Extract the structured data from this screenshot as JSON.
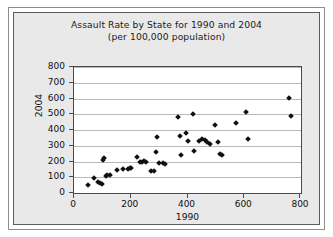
{
  "chart_data": {
    "type": "scatter",
    "title": "Assault Rate by State for 1990 and 2004",
    "subtitle": "(per 100,000 population)",
    "xlabel": "1990",
    "ylabel": "2004",
    "xlim": [
      0,
      800
    ],
    "ylim": [
      0,
      800
    ],
    "xticks": [
      0,
      200,
      400,
      600,
      800
    ],
    "yticks": [
      0,
      100,
      200,
      300,
      400,
      500,
      600,
      700,
      800
    ],
    "grid": "horizontal",
    "legend": "none",
    "marker": "diamond",
    "marker_color": "#111111",
    "points": [
      {
        "x": 48,
        "y": 50
      },
      {
        "x": 72,
        "y": 95
      },
      {
        "x": 85,
        "y": 72
      },
      {
        "x": 92,
        "y": 62
      },
      {
        "x": 98,
        "y": 60
      },
      {
        "x": 103,
        "y": 210
      },
      {
        "x": 106,
        "y": 225
      },
      {
        "x": 112,
        "y": 105
      },
      {
        "x": 118,
        "y": 112
      },
      {
        "x": 126,
        "y": 115
      },
      {
        "x": 150,
        "y": 148
      },
      {
        "x": 172,
        "y": 150
      },
      {
        "x": 190,
        "y": 152
      },
      {
        "x": 196,
        "y": 160
      },
      {
        "x": 200,
        "y": 158
      },
      {
        "x": 222,
        "y": 228
      },
      {
        "x": 232,
        "y": 200
      },
      {
        "x": 240,
        "y": 198
      },
      {
        "x": 248,
        "y": 205
      },
      {
        "x": 252,
        "y": 196
      },
      {
        "x": 272,
        "y": 140
      },
      {
        "x": 282,
        "y": 138
      },
      {
        "x": 288,
        "y": 262
      },
      {
        "x": 292,
        "y": 355
      },
      {
        "x": 300,
        "y": 190
      },
      {
        "x": 312,
        "y": 188
      },
      {
        "x": 322,
        "y": 186
      },
      {
        "x": 368,
        "y": 480
      },
      {
        "x": 372,
        "y": 360
      },
      {
        "x": 378,
        "y": 240
      },
      {
        "x": 396,
        "y": 380
      },
      {
        "x": 400,
        "y": 330
      },
      {
        "x": 418,
        "y": 502
      },
      {
        "x": 422,
        "y": 268
      },
      {
        "x": 440,
        "y": 330
      },
      {
        "x": 452,
        "y": 340
      },
      {
        "x": 462,
        "y": 338
      },
      {
        "x": 470,
        "y": 322
      },
      {
        "x": 478,
        "y": 312
      },
      {
        "x": 498,
        "y": 432
      },
      {
        "x": 508,
        "y": 322
      },
      {
        "x": 516,
        "y": 250
      },
      {
        "x": 522,
        "y": 244
      },
      {
        "x": 570,
        "y": 444
      },
      {
        "x": 606,
        "y": 512
      },
      {
        "x": 612,
        "y": 345
      },
      {
        "x": 758,
        "y": 602
      },
      {
        "x": 766,
        "y": 490
      }
    ]
  }
}
